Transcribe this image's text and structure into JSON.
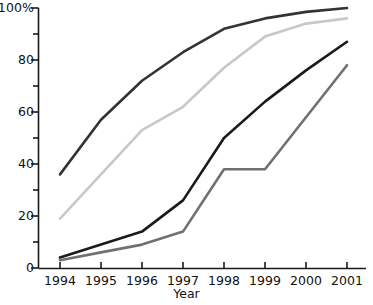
{
  "chart_data": {
    "type": "line",
    "title": "",
    "subtitle": "",
    "xlabel": "Year",
    "ylabel": "",
    "x": [
      1994,
      1995,
      1996,
      1997,
      1998,
      1999,
      2000,
      2001
    ],
    "categories": [
      "1994",
      "1995",
      "1996",
      "1997",
      "1998",
      "1999",
      "2000",
      "2001"
    ],
    "xlim": [
      1994,
      2001
    ],
    "ylim": [
      0,
      100
    ],
    "grid": false,
    "legend": "none",
    "y_major_ticks": [
      0,
      20,
      40,
      60,
      80,
      100
    ],
    "y_minor_ticks": [
      10,
      30,
      50,
      70,
      90
    ],
    "y_tick_labels": [
      "0",
      "20",
      "40",
      "60",
      "80",
      "100%"
    ],
    "x_tick_labels": [
      "1994",
      "1995",
      "1996",
      "1997",
      "1998",
      "1999",
      "2000",
      "2001"
    ],
    "series": [
      {
        "name": "series-1-dark",
        "color": "#333333",
        "width": 2.6,
        "values": [
          36,
          57,
          72,
          83,
          92,
          96,
          98.5,
          100
        ]
      },
      {
        "name": "series-2-light-gray",
        "color": "#c8c8c8",
        "width": 2.6,
        "values": [
          19,
          36,
          53,
          62,
          77,
          89,
          94,
          96
        ]
      },
      {
        "name": "series-3-black",
        "color": "#1a1a1a",
        "width": 2.6,
        "values": [
          4,
          9,
          14,
          26,
          50,
          64,
          76,
          87
        ]
      },
      {
        "name": "series-4-medium-gray",
        "color": "#707070",
        "width": 2.6,
        "values": [
          3,
          6,
          9,
          14,
          38,
          38,
          58,
          78
        ]
      }
    ]
  },
  "axes": {
    "y_label_100": "100%",
    "y_label_80": "80",
    "y_label_60": "60",
    "y_label_40": "40",
    "y_label_20": "20",
    "y_label_0": "0",
    "x_label_1994": "1994",
    "x_label_1995": "1995",
    "x_label_1996": "1996",
    "x_label_1997": "1997",
    "x_label_1998": "1998",
    "x_label_1999": "1999",
    "x_label_2000": "2000",
    "x_label_2001": "2001",
    "x_axis_title": "Year"
  },
  "style": {
    "axis_color": "#1a1a1a",
    "background": "#ffffff",
    "text_color": "#111111"
  }
}
